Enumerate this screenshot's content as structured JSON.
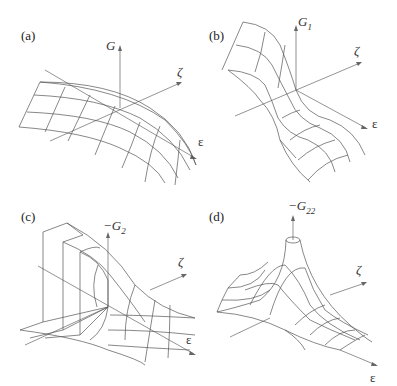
{
  "figure": {
    "panels": [
      {
        "id": "a",
        "label": "(a)",
        "vertical_axis": {
          "symbol": "G",
          "subscript": ""
        },
        "depth_axis": "ζ",
        "horizontal_axis": "ε",
        "surface": "saddle-ridge, smooth cylindrical ridge along ε"
      },
      {
        "id": "b",
        "label": "(b)",
        "vertical_axis": {
          "symbol": "G",
          "subscript": "1"
        },
        "depth_axis": "ζ",
        "horizontal_axis": "ε",
        "surface": "sigmoid step surface rising toward -ε"
      },
      {
        "id": "c",
        "label": "(c)",
        "vertical_axis": {
          "symbol": "−G",
          "subscript": "2"
        },
        "depth_axis": "ζ",
        "horizontal_axis": "ε",
        "surface": "discontinuous wall with singular edge"
      },
      {
        "id": "d",
        "label": "(d)",
        "vertical_axis": {
          "symbol": "−G",
          "subscript": "22"
        },
        "depth_axis": "ζ",
        "horizontal_axis": "ε",
        "surface": "sharp peak at origin (truncated)"
      }
    ]
  }
}
